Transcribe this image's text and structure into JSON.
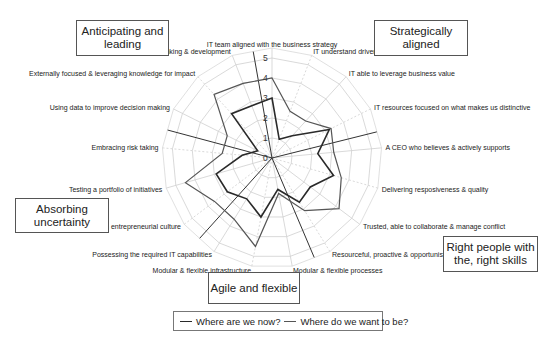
{
  "chart_data": {
    "type": "radar",
    "title": "",
    "center": [
      272,
      158
    ],
    "unit_px": 20,
    "range": [
      0,
      5
    ],
    "ticks": [
      "0",
      "1",
      "2",
      "3",
      "4",
      "5"
    ],
    "categories": [
      "IT team aligned with the business strategy",
      "IT understand drivers of business success",
      "IT able to leverage business value",
      "IT resources focused on what makes us distinctive",
      "A CEO who believes & actively supports",
      "Delivering resposiveness & quality",
      "Trusted, able to collaborate & manage conflict",
      "Resourceful, proactive & opportunistic",
      "Modular & flexible processes",
      "Modular & flexible infrastructure",
      "Possessing the required IT capabilities",
      "An entrepreneurial culture",
      "Testing a portfolio of initiatives",
      "Embracing risk taking",
      "Using data to improve decision making",
      "Externally focused & leveraging knowledge for impact",
      "Leading business thinking & development"
    ],
    "series": [
      {
        "name": "Where are we now?",
        "color": "#2a2a2a",
        "width": 1.6,
        "values": [
          3,
          1,
          1.5,
          3.2,
          2.3,
          3.2,
          2.4,
          2.6,
          1.6,
          3,
          2.4,
          2.8,
          2.9,
          1.5,
          0.8,
          3,
          2.8
        ]
      },
      {
        "name": "Where do we want to be?",
        "color": "#555555",
        "width": 1.2,
        "values": [
          4,
          2.5,
          2.5,
          3.3,
          3.1,
          3.6,
          4.2,
          3.1,
          1.8,
          4.5,
          3.6,
          3.6,
          4.5,
          2.5,
          2.5,
          4.3,
          4
        ]
      }
    ],
    "dividers_deg": [
      -10,
      76,
      157,
      222,
      285
    ],
    "grid": true,
    "legend_position": "bottom"
  },
  "groups": {
    "anticipating": "Anticipating and leading",
    "strategic": "Strategically aligned",
    "absorbing": "Absorbing uncertainty",
    "right_people": "Right people with the, right skills",
    "agile": "Agile and flexible"
  },
  "legend": {
    "now": "Where are we now?",
    "want": "Where do we want to be?"
  }
}
